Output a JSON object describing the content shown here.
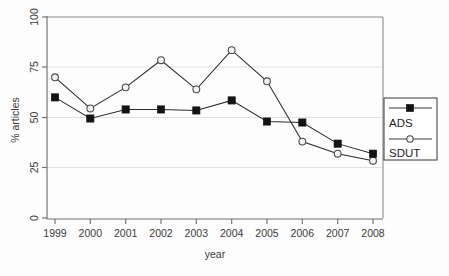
{
  "chart_data": {
    "type": "line",
    "title": "",
    "xlabel": "year",
    "ylabel": "% articles",
    "categories": [
      "1999",
      "2000",
      "2001",
      "2002",
      "2003",
      "2004",
      "2005",
      "2006",
      "2007",
      "2008"
    ],
    "x": [
      1999,
      2000,
      2001,
      2002,
      2003,
      2004,
      2005,
      2006,
      2007,
      2008
    ],
    "series": [
      {
        "name": "ADS",
        "marker": "filled-square",
        "color": "#141414",
        "values": [
          60,
          49.5,
          54,
          54,
          53.5,
          58.5,
          48,
          47.5,
          37,
          32
        ]
      },
      {
        "name": "SDUT",
        "marker": "open-circle",
        "color": "#4a4a4a",
        "values": [
          70,
          54.5,
          65,
          78.5,
          64,
          83.5,
          68,
          38,
          32,
          28.5
        ]
      }
    ],
    "ylim": [
      0,
      100
    ],
    "yticks": [
      0,
      25,
      50,
      75,
      100
    ],
    "ytick_labels": [
      "0",
      "25",
      "50",
      "75",
      "100"
    ],
    "xtick_labels": [
      "1999",
      "2000",
      "2001",
      "2002",
      "2003",
      "2004",
      "2005",
      "2006",
      "2007",
      "2008"
    ],
    "grid": true,
    "grid_axis": "y",
    "legend_position": "right-outside",
    "legend_entries": [
      "ADS",
      "SDUT"
    ]
  },
  "legend": {
    "entries": [
      {
        "label": "ADS",
        "marker": "filled-square"
      },
      {
        "label": "SDUT",
        "marker": "open-circle"
      }
    ]
  },
  "axes": {
    "x_title": "year",
    "y_title": "% articles"
  }
}
